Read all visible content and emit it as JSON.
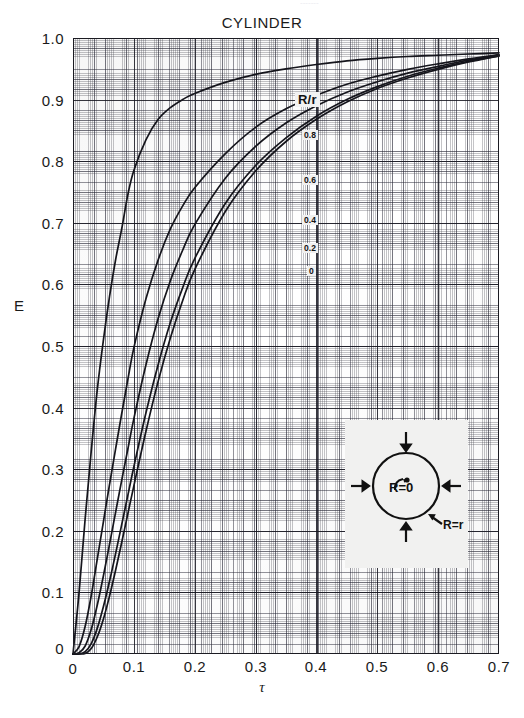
{
  "header": {
    "title": "CYLINDER",
    "top_cut_text": "-------"
  },
  "axes": {
    "y_title": "E",
    "x_title": "τ",
    "y_ticks": [
      "1.0",
      "0.9",
      "0.8",
      "0.7",
      "0.6",
      "0.5",
      "0.4",
      "0.3",
      "0.2",
      "0.1",
      "0"
    ],
    "x_ticks": [
      "0",
      "0.1",
      "0.2",
      "0.3",
      "0.4",
      "0.5",
      "0.6",
      "0.7"
    ],
    "origin_y_label": "0"
  },
  "legend": {
    "title": "R/r",
    "labels": [
      "0.8",
      "0.6",
      "0.4",
      "0.2",
      "0"
    ]
  },
  "inset": {
    "center_label": "R=0",
    "edge_label": "R=r",
    "arrow_count": 4,
    "shape": "circle"
  },
  "colors": {
    "ink": "#15151c",
    "grid_major": "#141420",
    "grid_medium": "#282837",
    "grid_fine": "#3c3c46",
    "paper": "#ffffff",
    "inset_bg": "#f1f1f0"
  },
  "chart_data": {
    "type": "line",
    "title": "CYLINDER",
    "subtitle": "",
    "xlabel": "τ",
    "ylabel": "E",
    "xlim": [
      0,
      0.7
    ],
    "ylim": [
      0,
      1.0
    ],
    "xticks": [
      0,
      0.1,
      0.2,
      0.3,
      0.4,
      0.5,
      0.6,
      0.7
    ],
    "yticks": [
      0,
      0.1,
      0.2,
      0.3,
      0.4,
      0.5,
      0.6,
      0.7,
      0.8,
      0.9,
      1.0
    ],
    "grid": true,
    "grid_style": "engineering graph paper, fine/medium/major rulings",
    "legend": {
      "title": "R/r",
      "position": "inline-labels-on-curves"
    },
    "x": [
      0,
      0.01,
      0.02,
      0.03,
      0.04,
      0.05,
      0.06,
      0.07,
      0.08,
      0.09,
      0.1,
      0.12,
      0.14,
      0.16,
      0.18,
      0.2,
      0.25,
      0.3,
      0.35,
      0.4,
      0.45,
      0.5,
      0.55,
      0.6,
      0.65,
      0.7
    ],
    "series": [
      {
        "name": "0.8",
        "label": "R/r = 0.8",
        "values": [
          0.0,
          0.1,
          0.22,
          0.33,
          0.43,
          0.51,
          0.58,
          0.64,
          0.69,
          0.745,
          0.785,
          0.835,
          0.868,
          0.887,
          0.9,
          0.91,
          0.928,
          0.941,
          0.95,
          0.957,
          0.963,
          0.967,
          0.97,
          0.972,
          0.974,
          0.976
        ]
      },
      {
        "name": "0.6",
        "label": "R/r = 0.6",
        "values": [
          0.0,
          0.012,
          0.045,
          0.095,
          0.155,
          0.215,
          0.275,
          0.333,
          0.39,
          0.445,
          0.497,
          0.577,
          0.64,
          0.69,
          0.727,
          0.757,
          0.812,
          0.855,
          0.885,
          0.907,
          0.925,
          0.938,
          0.949,
          0.958,
          0.966,
          0.973
        ]
      },
      {
        "name": "0.4",
        "label": "R/r = 0.4",
        "values": [
          0.0,
          0.002,
          0.013,
          0.04,
          0.08,
          0.127,
          0.178,
          0.23,
          0.282,
          0.332,
          0.382,
          0.47,
          0.545,
          0.606,
          0.655,
          0.697,
          0.772,
          0.824,
          0.862,
          0.89,
          0.912,
          0.929,
          0.943,
          0.954,
          0.964,
          0.972
        ]
      },
      {
        "name": "0.2",
        "label": "R/r = 0.2",
        "values": [
          0.0,
          0.0,
          0.004,
          0.017,
          0.042,
          0.077,
          0.118,
          0.163,
          0.21,
          0.257,
          0.304,
          0.392,
          0.47,
          0.538,
          0.594,
          0.642,
          0.731,
          0.793,
          0.838,
          0.873,
          0.9,
          0.921,
          0.938,
          0.951,
          0.962,
          0.971
        ]
      },
      {
        "name": "0",
        "label": "R/r = 0",
        "values": [
          0.0,
          0.0,
          0.001,
          0.009,
          0.028,
          0.057,
          0.094,
          0.136,
          0.181,
          0.227,
          0.273,
          0.362,
          0.443,
          0.513,
          0.573,
          0.624,
          0.718,
          0.784,
          0.832,
          0.868,
          0.896,
          0.918,
          0.935,
          0.949,
          0.961,
          0.971
        ]
      }
    ],
    "annotations": [
      {
        "text": "R/r",
        "role": "series-group-title"
      },
      {
        "text": "0.8",
        "role": "curve-label"
      },
      {
        "text": "0.6",
        "role": "curve-label"
      },
      {
        "text": "0.4",
        "role": "curve-label"
      },
      {
        "text": "0.2",
        "role": "curve-label"
      },
      {
        "text": "0",
        "role": "curve-label"
      },
      {
        "text": "R=0",
        "role": "inset-label"
      },
      {
        "text": "R=r",
        "role": "inset-label"
      }
    ]
  }
}
